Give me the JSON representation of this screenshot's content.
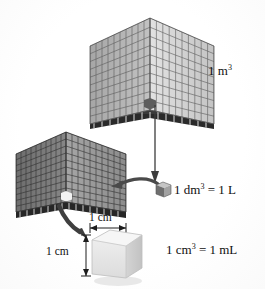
{
  "figure": {
    "background_color": "#ffffff",
    "ink_color": "#101010"
  },
  "labels": {
    "cubic_metre": {
      "value": "1 m",
      "exponent": "3"
    },
    "cubic_decimetre": {
      "value": "1 dm",
      "exponent": "3",
      "equals": " = 1 L"
    },
    "cubic_centimetre": {
      "value": "1 cm",
      "exponent": "3",
      "equals": " = 1 mL"
    },
    "dimension_top": "1 cm",
    "dimension_left": "1 cm"
  },
  "objects": {
    "large_cube": {
      "name": "cubic-metre-cube",
      "grid_divisions": 10,
      "face_colors": {
        "left": "#b4b4b4",
        "right": "#d8d8d8",
        "edge": "#4a4a4a"
      }
    },
    "medium_cube": {
      "name": "cubic-decimetre-cube",
      "grid_divisions": 10,
      "face_colors": {
        "left": "#808080",
        "right": "#9b9b9b",
        "edge": "#2f2f2f"
      },
      "highlight_cell_color": "#f2f2f2"
    },
    "small_gray_cube": {
      "name": "litre-unit-cube",
      "face_colors": {
        "left": "#787878",
        "right": "#a8a8a8",
        "top": "#c8c8c8"
      }
    },
    "white_cube": {
      "name": "cubic-centimetre-cube",
      "face_colors": {
        "left": "#e4e4e4",
        "right": "#cfcfcf",
        "top": "#f4f4f4"
      }
    }
  },
  "arrows": {
    "metre_to_litre": {
      "name": "arrow-metre-to-decimetre",
      "style": "straight-vertical"
    },
    "litre_to_decimetre_cube": {
      "name": "arrow-litre-to-cube",
      "style": "curved-left"
    },
    "decimetre_to_centimetre": {
      "name": "arrow-decimetre-to-centimetre",
      "style": "curved-thick"
    }
  }
}
